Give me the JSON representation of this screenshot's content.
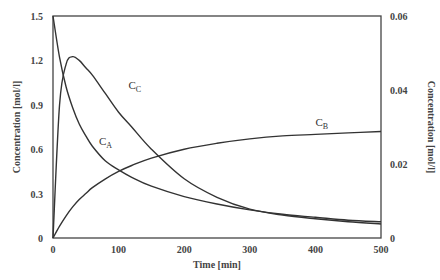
{
  "chart_data": {
    "type": "line",
    "title": "",
    "xlabel": "Time [min]",
    "ylabel": "Concentration [mol/l]",
    "y2label": "Concentration [mol/l]",
    "xlim": [
      0,
      500
    ],
    "ylim": [
      0,
      1.5
    ],
    "y2lim": [
      0,
      0.06
    ],
    "grid": false,
    "legend": "inline curve labels",
    "x_ticks": [
      "0",
      "100",
      "200",
      "300",
      "400",
      "500"
    ],
    "y_ticks": [
      "0",
      "0.3",
      "0.6",
      "0.9",
      "1.2",
      "1.5"
    ],
    "y2_ticks": [
      "0",
      "0.02",
      "0.04",
      "0.06"
    ],
    "x": [
      0,
      10,
      20,
      30,
      40,
      50,
      60,
      80,
      100,
      120,
      150,
      200,
      250,
      300,
      350,
      400,
      450,
      500
    ],
    "series": [
      {
        "name": "C_A",
        "axis": "left",
        "values": [
          1.5,
          1.22,
          1.02,
          0.88,
          0.77,
          0.69,
          0.62,
          0.52,
          0.46,
          0.41,
          0.35,
          0.28,
          0.23,
          0.19,
          0.16,
          0.14,
          0.12,
          0.11
        ]
      },
      {
        "name": "C_B",
        "axis": "left",
        "values": [
          0.0,
          0.08,
          0.15,
          0.21,
          0.26,
          0.3,
          0.34,
          0.4,
          0.45,
          0.49,
          0.54,
          0.6,
          0.64,
          0.67,
          0.69,
          0.7,
          0.71,
          0.72
        ]
      },
      {
        "name": "C_C",
        "axis": "right",
        "values": [
          0.0,
          0.036,
          0.047,
          0.049,
          0.048,
          0.046,
          0.044,
          0.039,
          0.034,
          0.03,
          0.024,
          0.016,
          0.011,
          0.0078,
          0.0062,
          0.0052,
          0.0044,
          0.0038
        ]
      }
    ],
    "annotations": [
      {
        "text": "C",
        "sub": "A",
        "x": 70,
        "y": 0.63
      },
      {
        "text": "C",
        "sub": "B",
        "x": 400,
        "y": 0.76
      },
      {
        "text": "C",
        "sub": "C",
        "x": 115,
        "y": 1.01
      }
    ]
  }
}
